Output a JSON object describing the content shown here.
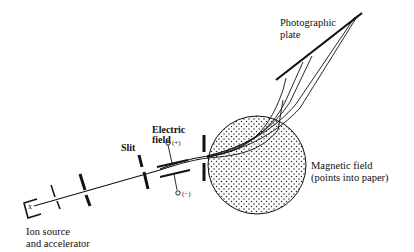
{
  "diagram": {
    "labels": {
      "photographic_plate_line1": "Photographic",
      "photographic_plate_line2": "plate",
      "electric_field_line1": "Electric",
      "electric_field_line2": "field",
      "plus_terminal": "(+)",
      "minus_terminal": "(−)",
      "slit": "Slit",
      "magnetic_field_line1": "Magnetic field",
      "magnetic_field_line2": "(points into paper)",
      "ion_source_line1": "Ion source",
      "ion_source_line2": "and accelerator",
      "source_marker": "x"
    },
    "colors": {
      "ink": "#111111",
      "background": "#ffffff"
    }
  }
}
